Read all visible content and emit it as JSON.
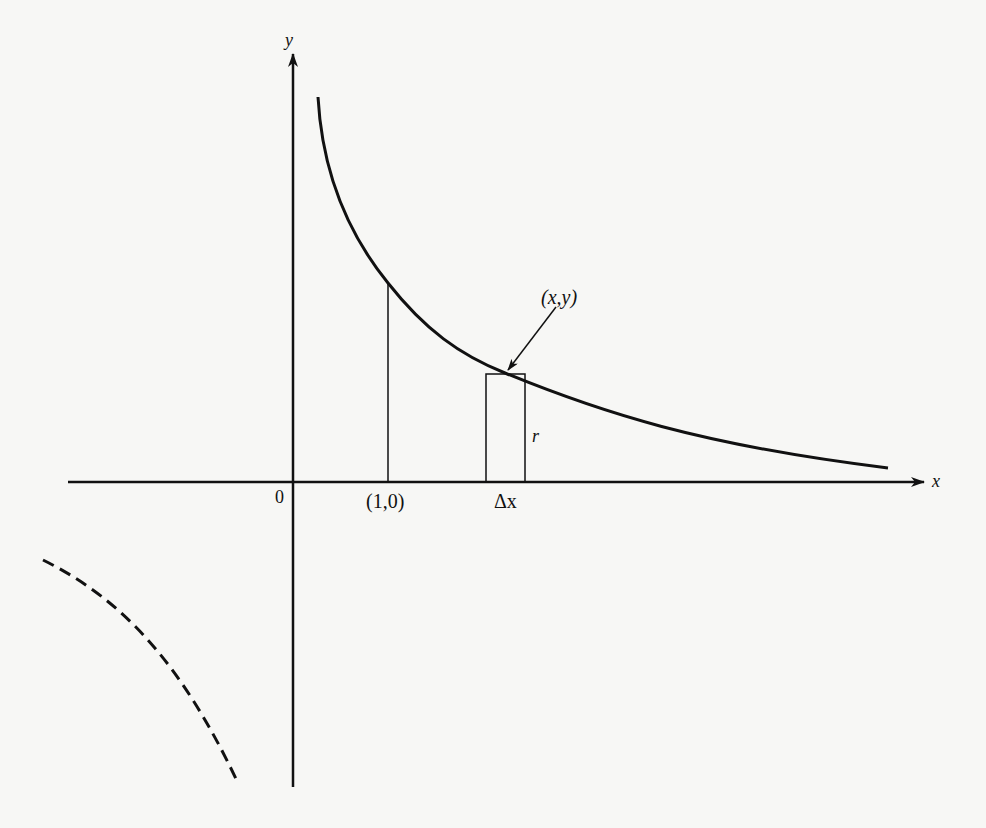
{
  "figure": {
    "type": "diagram",
    "colors": {
      "ink": "#111111",
      "background": "#f7f7f5"
    }
  },
  "axes": {
    "x_label": "x",
    "y_label": "y",
    "origin_label": "0"
  },
  "annotations": {
    "point_1_0": "(1,0)",
    "delta_x": "Δx",
    "point_xy": "(x,y)",
    "radius": "r"
  },
  "curves": [
    {
      "name": "hyperbola-branch-first-quadrant",
      "style": "solid"
    },
    {
      "name": "hyperbola-branch-third-quadrant",
      "style": "dashed"
    }
  ]
}
